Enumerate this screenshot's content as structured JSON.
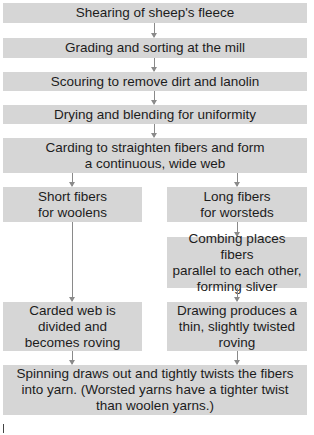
{
  "diagram": {
    "type": "flowchart",
    "colors": {
      "box_fill": "#d6d6d6",
      "arrow": "#8a8a8a",
      "text": "#1c1c1c",
      "background": "#ffffff"
    },
    "steps": {
      "shearing": "Shearing of sheep's fleece",
      "grading": "Grading and sorting at the mill",
      "scouring": "Scouring to remove dirt and lanolin",
      "drying": "Drying and blending for uniformity",
      "carding": "Carding to straighten fibers and form\na continuous, wide web",
      "short_fibers": "Short fibers\nfor woolens",
      "long_fibers": "Long fibers\nfor worsteds",
      "combing": "Combing places fibers\nparallel to each other,\nforming sliver",
      "carded_web": "Carded web is\ndivided and\nbecomes roving",
      "drawing": "Drawing produces a\nthin, slightly twisted\nroving",
      "spinning": "Spinning draws out and tightly twists the fibers\ninto yarn. (Worsted yarns have a tighter twist\nthan woolen yarns.)"
    },
    "edges": [
      [
        "shearing",
        "grading"
      ],
      [
        "grading",
        "scouring"
      ],
      [
        "scouring",
        "drying"
      ],
      [
        "drying",
        "carding"
      ],
      [
        "carding",
        "short_fibers"
      ],
      [
        "carding",
        "long_fibers"
      ],
      [
        "short_fibers",
        "carded_web"
      ],
      [
        "long_fibers",
        "combing"
      ],
      [
        "combing",
        "drawing"
      ],
      [
        "carded_web",
        "spinning"
      ],
      [
        "drawing",
        "spinning"
      ]
    ]
  }
}
